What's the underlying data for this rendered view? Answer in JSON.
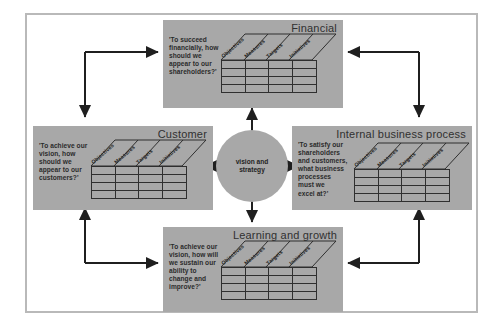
{
  "diagram": {
    "panel_color": "#a8a8a8",
    "frame_color": "#b9b9b9",
    "line_color": "#1f1f1f"
  },
  "hub": {
    "label": "vision and\nstrategy"
  },
  "columns": [
    "Objectives",
    "Measures",
    "Targets",
    "Initiatives"
  ],
  "grid": {
    "rows": 4,
    "cols": 4
  },
  "perspectives": [
    {
      "id": "financial",
      "title": "Financial",
      "question": "'To succeed\nfinancially, how\nshould we\nappear to our\nshareholders?'"
    },
    {
      "id": "customer",
      "title": "Customer",
      "question": "'To achieve our\nvision, how\nshould we\nappear to our\ncustomers?'"
    },
    {
      "id": "internal-business-process",
      "title": "Internal business process",
      "question": "'To satisfy our\nshareholders\nand customers,\nwhat business\nprocesses\nmust we\nexcel at?'"
    },
    {
      "id": "learning-and-growth",
      "title": "Learning and growth",
      "question": "'To achieve our\nvision, how will\nwe sustain our\nability to\nchange and\nimprove?'"
    }
  ]
}
